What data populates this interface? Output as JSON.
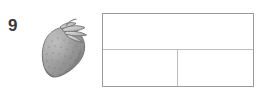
{
  "worksheet_item": {
    "number": "9",
    "illustration": {
      "icon": "strawberry-illustration",
      "subject": "strawberry",
      "style": "grayscale-clipart",
      "body_color": "#9e9e9e",
      "body_shadow_color": "#7d7d7d",
      "outline_color": "#6b6b6b",
      "leaf_color": "#c9c9c9",
      "seed_color": "#6f6f6f"
    },
    "answer_table": {
      "rows": [
        {
          "name": "top-row",
          "cells": [
            {
              "name": "top-cell",
              "value": ""
            }
          ]
        },
        {
          "name": "bottom-row",
          "cells": [
            {
              "name": "bottom-left-cell",
              "value": ""
            },
            {
              "name": "bottom-right-cell",
              "value": ""
            }
          ]
        }
      ],
      "border_color": "#9a9a9a",
      "divider_color": "#bcbcbc",
      "fill_color": "#ffffff"
    }
  },
  "page": {
    "background_color": "#ffffff"
  }
}
